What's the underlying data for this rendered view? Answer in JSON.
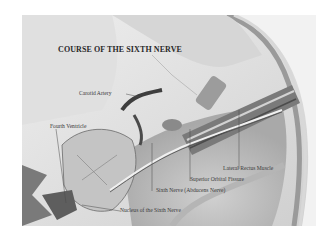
{
  "figure": {
    "title": "COURSE OF THE SIXTH NERVE",
    "labels": {
      "carotid_artery": "Carotid Artery",
      "fourth_ventricle": "Fourth Ventricle",
      "lateral_rectus_muscle": "Lateral Rectus Muscle",
      "superior_orbital_fissure": "Superior Orbital Fissure",
      "sixth_nerve": "Sixth Nerve (Abducens Nerve)",
      "nucleus_sixth_nerve": "Nucleus of the Sixth Nerve"
    },
    "colors": {
      "background": "#ffffff",
      "plate": "#e9e9e9",
      "skull_shade": "#bdbdbd",
      "dark_shade": "#5a5a5a",
      "label_text": "#3a3a3a"
    }
  }
}
